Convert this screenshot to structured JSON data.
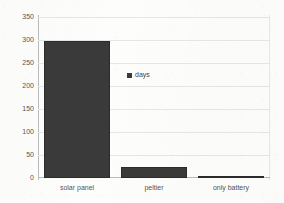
{
  "chart_data": {
    "type": "bar",
    "title": "",
    "subtitle": "",
    "xlabel": "",
    "ylabel": "",
    "categories": [
      "solar panel",
      "peltier",
      "only battery"
    ],
    "series": [
      {
        "name": "days",
        "values": [
          300,
          25,
          5
        ]
      }
    ],
    "ylim": [
      0,
      350
    ],
    "yticks": [
      0,
      50,
      100,
      150,
      200,
      250,
      300,
      350
    ],
    "ytick_labels": [
      "0",
      "50",
      "100",
      "150",
      "200",
      "250",
      "300",
      "350"
    ],
    "grid": true,
    "legend": {
      "position": "inside-center",
      "entries": [
        "days"
      ]
    },
    "colors": {
      "bar": "#3a3a3a",
      "bar_edge": "#2b2b2b",
      "gridline": "#e4e6e8",
      "axis": "#b9bcbf",
      "text": "#555555",
      "background": "#fdfdfc"
    }
  }
}
